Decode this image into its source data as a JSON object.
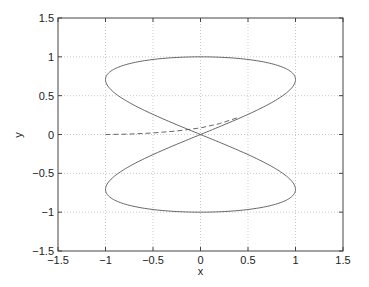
{
  "chart_data": {
    "type": "line",
    "title": "",
    "xlabel": "x",
    "ylabel": "y",
    "xlim": [
      -1.5,
      1.5
    ],
    "ylim": [
      -1.5,
      1.5
    ],
    "xticks": [
      -1.5,
      -1,
      -0.5,
      0,
      0.5,
      1,
      1.5
    ],
    "yticks": [
      -1.5,
      -1,
      -0.5,
      0,
      0.5,
      1,
      1.5
    ],
    "xtick_labels": [
      "-1.5",
      "-1",
      "-0.5",
      "0",
      "0.5",
      "1",
      "1.5"
    ],
    "ytick_labels": [
      "-1.5",
      "-1",
      "-0.5",
      "0",
      "0.5",
      "1",
      "1.5"
    ],
    "grid": true,
    "legend": null,
    "series": [
      {
        "name": "figure-eight curve",
        "style": "solid",
        "color": "#555555",
        "parametric": "x = sin(2t), y = cos(t), t in [0, 2π]",
        "x": [
          0,
          0.5,
          0.866,
          1,
          0.866,
          0.5,
          0,
          -0.5,
          -0.866,
          -1,
          -0.866,
          -0.5,
          0,
          0.5,
          0.866,
          1,
          0.866,
          0.5,
          0,
          -0.5,
          -0.866,
          -1,
          -0.866,
          -0.5,
          0
        ],
        "y": [
          1,
          0.966,
          0.866,
          0.707,
          0.5,
          0.259,
          0,
          -0.259,
          -0.5,
          -0.707,
          -0.866,
          -0.966,
          -1,
          -0.966,
          -0.866,
          -0.707,
          -0.5,
          -0.259,
          0,
          0.259,
          0.5,
          0.707,
          0.866,
          0.966,
          1
        ]
      },
      {
        "name": "dashed path",
        "style": "dashed",
        "color": "#555555",
        "x": [
          -1,
          -0.75,
          -0.5,
          -0.25,
          0,
          0.2,
          0.4
        ],
        "y": [
          0,
          0.005,
          0.02,
          0.045,
          0.085,
          0.14,
          0.22
        ]
      }
    ]
  },
  "labels": {
    "xlabel": "x",
    "ylabel": "y"
  }
}
